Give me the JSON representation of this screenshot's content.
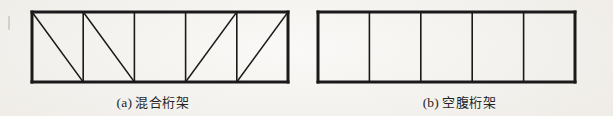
{
  "figure": {
    "background_color": "#f2f0ec",
    "ink_color": "#1a1a1a",
    "diagrams": [
      {
        "id": "truss-a",
        "caption_label": "(a)",
        "caption_text": "混合桁架",
        "type": "hybrid-truss",
        "geometry": {
          "x": 32,
          "y": 12,
          "width": 256,
          "height": 70,
          "panels": 5,
          "outer_stroke_width": 3.0,
          "inner_stroke_width": 1.6,
          "diagonal_stroke_width": 1.6
        },
        "panel_diagonals": [
          "backslash",
          "backslash",
          "none",
          "slash",
          "slash"
        ]
      },
      {
        "id": "truss-b",
        "caption_label": "(b)",
        "caption_text": "空腹桁架",
        "type": "vierendeel-truss",
        "geometry": {
          "x": 12,
          "y": 12,
          "width": 257,
          "height": 70,
          "panels": 5,
          "outer_stroke_width": 3.0,
          "inner_stroke_width": 1.6,
          "diagonal_stroke_width": 0
        },
        "panel_diagonals": [
          "none",
          "none",
          "none",
          "none",
          "none"
        ]
      }
    ]
  }
}
